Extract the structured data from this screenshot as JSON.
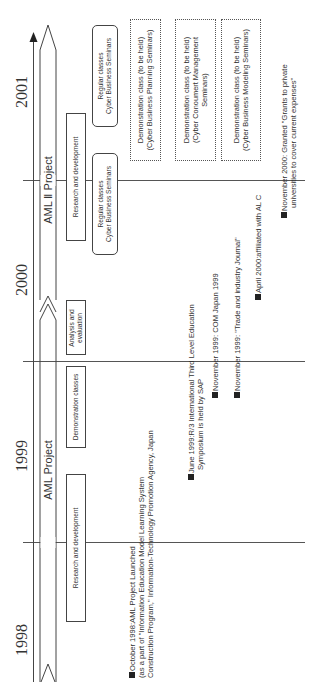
{
  "years": [
    "2001",
    "2000",
    "1999",
    "1998"
  ],
  "projects": {
    "aml": "AML Project",
    "aml2": "AML Ⅱ Project"
  },
  "phases": {
    "rd_1998": "Research and development",
    "demo_1999": "Demonstration classes",
    "analysis": "Analysis and evaluation",
    "analysis_l1": "Analysis and",
    "analysis_l2": "evaluation",
    "rd_2000": "Research and development"
  },
  "regular_classes": [
    {
      "line1": "Regular classes",
      "line2": "Cyber Business Seminars"
    },
    {
      "line1": "Regular classes",
      "line2": "Cyber Business Seminars"
    }
  ],
  "planned_demos": [
    {
      "line1": "Demonstration class (to be held)",
      "line2": "(Cyber Business Planning Seminars)",
      "line3": ""
    },
    {
      "line1": "Demonstration class (to be held)",
      "line2": "(Cyber Conoumert Management",
      "line3": "Seminars)"
    },
    {
      "line1": "Demonstration class (to be held)",
      "line2": "(Cyber Business Modeling Seminars)",
      "line3": ""
    }
  ],
  "events": [
    {
      "lines": [
        "October 1998:AML Project Launched",
        "(as a part of \"Information Education Model Learning System",
        "Construction Program,\" Information-Technology Promotion Agency, Japan"
      ]
    },
    {
      "lines": [
        "June 1999:R/3 International Third Level Education",
        "Symposium is held by SAP"
      ]
    },
    {
      "lines": [
        "November 1999: COM Japan 1999"
      ]
    },
    {
      "lines": [
        "November 1999: \"Trade and industry Journal\""
      ]
    },
    {
      "lines": [
        "April 2000:affiliated with AL C"
      ]
    },
    {
      "lines": [
        "November 2000: Granted \"Grants to private",
        "universities to cover current expenses\""
      ]
    }
  ],
  "colors": {
    "line": "#555555",
    "text": "#333333",
    "marker": "#222222"
  }
}
